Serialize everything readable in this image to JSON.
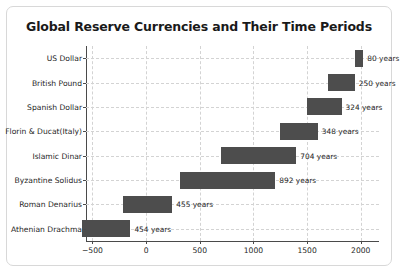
{
  "chart_data": {
    "type": "bar",
    "subtype": "horizontal-range-bars",
    "title": "Global Reserve Currencies and Their Time Periods",
    "xlabel": "",
    "ylabel": "",
    "xlim": [
      -560,
      2170
    ],
    "xticks": [
      -500,
      0,
      500,
      1000,
      1500,
      2000
    ],
    "xticklabels": [
      "−500",
      "0",
      "500",
      "1000",
      "1500",
      "2000"
    ],
    "grid": true,
    "legend": false,
    "bar_color": "#4d4d4d",
    "categories": [
      "US Dollar",
      "British Pound",
      "Spanish Dollar",
      "Florin & Ducat(Italy)",
      "Islamic Dinar",
      "Byzantine Solidus",
      "Roman Denarius",
      "Athenian Drachma"
    ],
    "bars": [
      {
        "category": "US Dollar",
        "start": 1944,
        "end": 2024,
        "duration": 80,
        "label": "80 years"
      },
      {
        "category": "British Pound",
        "start": 1694,
        "end": 1944,
        "duration": 250,
        "label": "250 years"
      },
      {
        "category": "Spanish Dollar",
        "start": 1497,
        "end": 1821,
        "duration": 324,
        "label": "324 years"
      },
      {
        "category": "Florin & Ducat(Italy)",
        "start": 1252,
        "end": 1600,
        "duration": 348,
        "label": "348 years"
      },
      {
        "category": "Islamic Dinar",
        "start": 696,
        "end": 1400,
        "duration": 704,
        "label": "704 years"
      },
      {
        "category": "Byzantine Solidus",
        "start": 312,
        "end": 1204,
        "duration": 892,
        "label": "892 years"
      },
      {
        "category": "Roman Denarius",
        "start": -211,
        "end": 244,
        "duration": 455,
        "label": "455 years"
      },
      {
        "category": "Athenian Drachma",
        "start": -600,
        "end": -146,
        "duration": 454,
        "label": "454 years"
      }
    ]
  }
}
